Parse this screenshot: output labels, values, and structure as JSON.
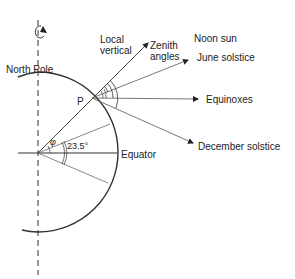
{
  "labels": {
    "north_pole": "North Pole",
    "local_vertical_line1": "Local",
    "local_vertical_line2": "vertical",
    "zenith_line1": "Zenith",
    "zenith_line2": "angles",
    "noon_sun": "Noon sun",
    "june_solstice": "June solstice",
    "equinoxes": "Equinoxes",
    "december_solstice": "December solstice",
    "equator": "Equator",
    "point_p": "P",
    "latitude_symbol": "φ",
    "tilt_angle": "23.5°"
  },
  "colors": {
    "line": "#333333",
    "text": "#222222"
  }
}
